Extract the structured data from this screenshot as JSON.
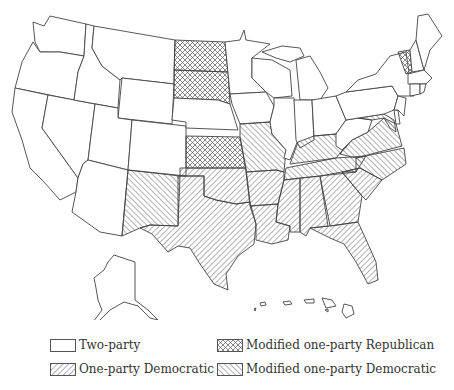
{
  "map": {
    "title": "Party competition by state",
    "categories": {
      "two_party": "Two-party",
      "one_party_dem": "One-party Democratic",
      "mod_rep": "Modified one-party Republican",
      "mod_dem": "Modified one-party Democratic"
    },
    "states": {
      "two_party": [
        "WA",
        "OR",
        "CA",
        "NV",
        "ID",
        "MT",
        "WY",
        "UT",
        "CO",
        "AZ",
        "NE",
        "MN",
        "IA",
        "WI",
        "IL",
        "MI",
        "IN",
        "OH",
        "WV",
        "PA",
        "NY",
        "NJ",
        "CT",
        "RI",
        "MA",
        "NH",
        "ME",
        "DE",
        "AK",
        "HI"
      ],
      "mod_rep": [
        "ND",
        "SD",
        "KS",
        "VT"
      ],
      "mod_dem": [
        "NM",
        "MO",
        "KY",
        "TN",
        "NC",
        "VA",
        "MD"
      ],
      "one_party_dem": [
        "TX",
        "OK",
        "AR",
        "LA",
        "MS",
        "AL",
        "GA",
        "SC",
        "FL"
      ]
    }
  },
  "legend": {
    "items": [
      {
        "label": "Two-party",
        "pattern": "none"
      },
      {
        "label": "Modified one-party Republican",
        "pattern": "crosshatch"
      },
      {
        "label": "One-party Democratic",
        "pattern": "backslash"
      },
      {
        "label": "Modified one-party Democratic",
        "pattern": "slash"
      }
    ]
  }
}
